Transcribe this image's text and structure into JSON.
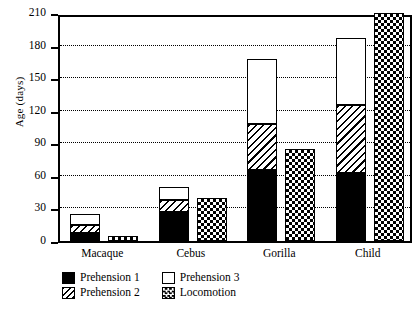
{
  "chart_data": {
    "type": "bar",
    "title": "",
    "xlabel": "",
    "ylabel": "Age (days)",
    "ylim": [
      0,
      210
    ],
    "yticks": [
      0,
      30,
      60,
      90,
      120,
      150,
      180,
      210
    ],
    "grid": "horizontal-dotted",
    "legend_position": "bottom-left",
    "stacked": true,
    "categories": [
      "Macaque",
      "Cebus",
      "Gorilla",
      "Child"
    ],
    "series": [
      {
        "name": "Prehension 1",
        "fill": "solid-black",
        "values": [
          7,
          27,
          65,
          63
        ]
      },
      {
        "name": "Prehension 2",
        "fill": "diagonal-hatch",
        "values": [
          8,
          11,
          43,
          62
        ]
      },
      {
        "name": "Prehension 3",
        "fill": "white",
        "values": [
          10,
          12,
          60,
          62
        ]
      },
      {
        "name": "Locomotion",
        "fill": "checkerboard",
        "values": [
          5,
          40,
          85,
          210
        ]
      }
    ],
    "stack_tops": {
      "Macaque": {
        "prehension_1": 7,
        "prehension_2": 15,
        "prehension_3": 25,
        "locomotion": 5
      },
      "Cebus": {
        "prehension_1": 27,
        "prehension_2": 38,
        "prehension_3": 50,
        "locomotion": 40
      },
      "Gorilla": {
        "prehension_1": 65,
        "prehension_2": 108,
        "prehension_3": 168,
        "locomotion": 85
      },
      "Child": {
        "prehension_1": 63,
        "prehension_2": 125,
        "prehension_3": 187,
        "locomotion": 210
      }
    }
  },
  "axis": {
    "y_title": "Age (days)",
    "tick_labels": [
      "210",
      "180",
      "150",
      "120",
      "90",
      "60",
      "30",
      "0"
    ]
  },
  "legend": {
    "items": [
      {
        "label": "Prehension 1",
        "fill": "p1"
      },
      {
        "label": "Prehension 3",
        "fill": "p3"
      },
      {
        "label": "Prehension 2",
        "fill": "p2"
      },
      {
        "label": "Locomotion",
        "fill": "loco"
      }
    ]
  }
}
